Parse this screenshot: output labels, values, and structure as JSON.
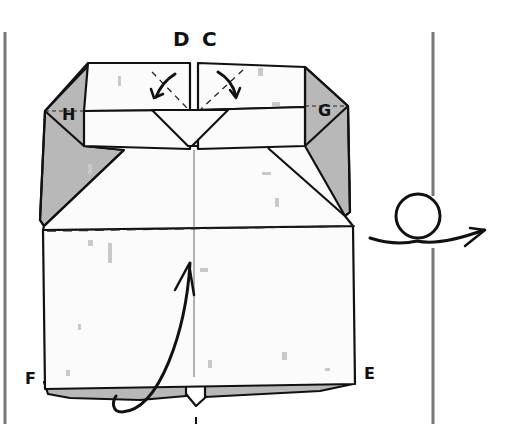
{
  "diagram": {
    "type": "origami-folding-step",
    "labels": {
      "D": "D",
      "C": "C",
      "H": "H",
      "G": "G",
      "F": "F",
      "E": "E"
    },
    "symbols": {
      "turn_over": "turn-over-icon",
      "valley_fold": "valley-fold-dashed-line",
      "fold_up_arrow": "fold-up-arrow-icon",
      "corner_fold_arrows": [
        "fold-arrow-left-icon",
        "fold-arrow-right-icon"
      ]
    },
    "colors": {
      "paper": "#fbfbfb",
      "shaded_paper": "#b8b8b8",
      "outline": "#111111",
      "frame_line": "#777777"
    }
  }
}
